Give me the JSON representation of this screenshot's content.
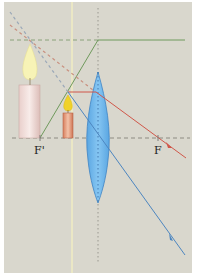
{
  "diagram": {
    "labels": {
      "focal_left": "F'",
      "focal_right": "F"
    },
    "colors": {
      "background": "#d9d7cd",
      "optical_axis": "#8a8a80",
      "lens_fill": "#6db6ec",
      "lens_stroke": "#3f84c4",
      "ray_green": "#6f9a5c",
      "ray_red": "#d0574a",
      "ray_blue": "#4d86c0",
      "guide_yellow": "#f4f0b8",
      "candle_big": "#f1dfdc",
      "candle_small": "#e59a78",
      "flame": "#f7f3b6",
      "flame_small": "#f0d22a"
    },
    "elements": {
      "lens": "converging lens (biconvex)",
      "object": "small candle (real object)",
      "image": "large candle (virtual, upright, magnified image)"
    }
  }
}
